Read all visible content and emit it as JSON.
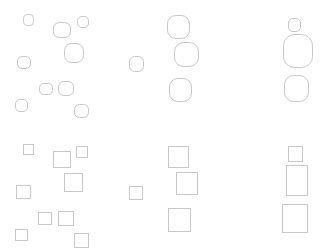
{
  "canvas": {
    "width": 321,
    "height": 250,
    "background": "#ffffff",
    "stroke": "#c8c8c8"
  },
  "panels": [
    {
      "name": "rounded-scattered",
      "shape": "rounded",
      "items": [
        {
          "x": 23,
          "y": 14,
          "w": 10,
          "h": 11
        },
        {
          "x": 53,
          "y": 22,
          "w": 17,
          "h": 15
        },
        {
          "x": 77,
          "y": 16,
          "w": 11,
          "h": 11
        },
        {
          "x": 64,
          "y": 43,
          "w": 19,
          "h": 19
        },
        {
          "x": 17,
          "y": 56,
          "w": 13,
          "h": 12
        },
        {
          "x": 39,
          "y": 83,
          "w": 13,
          "h": 11
        },
        {
          "x": 58,
          "y": 81,
          "w": 15,
          "h": 14
        },
        {
          "x": 15,
          "y": 99,
          "w": 12,
          "h": 12
        },
        {
          "x": 74,
          "y": 104,
          "w": 14,
          "h": 13
        }
      ]
    },
    {
      "name": "rounded-aligned",
      "shape": "rounded",
      "items": [
        {
          "x": 167,
          "y": 15,
          "w": 22,
          "h": 23
        },
        {
          "x": 174,
          "y": 42,
          "w": 24,
          "h": 24
        },
        {
          "x": 129,
          "y": 56,
          "w": 14,
          "h": 15
        },
        {
          "x": 169,
          "y": 78,
          "w": 22,
          "h": 23
        }
      ]
    },
    {
      "name": "rounded-stacked",
      "shape": "rounded",
      "items": [
        {
          "x": 288,
          "y": 18,
          "w": 12,
          "h": 13
        },
        {
          "x": 283,
          "y": 34,
          "w": 29,
          "h": 33
        },
        {
          "x": 284,
          "y": 75,
          "w": 24,
          "h": 26
        }
      ]
    },
    {
      "name": "square-scattered",
      "shape": "square",
      "items": [
        {
          "x": 23,
          "y": 144,
          "w": 10,
          "h": 10
        },
        {
          "x": 53,
          "y": 151,
          "w": 17,
          "h": 16
        },
        {
          "x": 76,
          "y": 146,
          "w": 11,
          "h": 11
        },
        {
          "x": 64,
          "y": 173,
          "w": 18,
          "h": 18
        },
        {
          "x": 16,
          "y": 185,
          "w": 14,
          "h": 13
        },
        {
          "x": 38,
          "y": 212,
          "w": 13,
          "h": 12
        },
        {
          "x": 58,
          "y": 211,
          "w": 15,
          "h": 14
        },
        {
          "x": 15,
          "y": 229,
          "w": 12,
          "h": 11
        },
        {
          "x": 74,
          "y": 233,
          "w": 14,
          "h": 14
        }
      ]
    },
    {
      "name": "square-aligned",
      "shape": "square",
      "items": [
        {
          "x": 168,
          "y": 146,
          "w": 20,
          "h": 21
        },
        {
          "x": 176,
          "y": 172,
          "w": 21,
          "h": 22
        },
        {
          "x": 129,
          "y": 186,
          "w": 13,
          "h": 13
        },
        {
          "x": 168,
          "y": 208,
          "w": 22,
          "h": 23
        }
      ]
    },
    {
      "name": "square-stacked",
      "shape": "square",
      "items": [
        {
          "x": 288,
          "y": 146,
          "w": 14,
          "h": 15
        },
        {
          "x": 286,
          "y": 165,
          "w": 21,
          "h": 30
        },
        {
          "x": 282,
          "y": 204,
          "w": 25,
          "h": 28
        }
      ]
    }
  ]
}
